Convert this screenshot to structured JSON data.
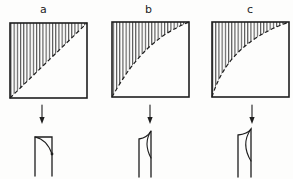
{
  "figure": {
    "description_labels": {
      "panel_a": "a",
      "panel_b": "b",
      "panel_c": "c"
    },
    "panels": [
      {
        "label": "a"
      },
      {
        "label": "b"
      },
      {
        "label": "c"
      }
    ]
  },
  "colors": {
    "ink": "#1e1e1e",
    "paper": "#fdfdfc"
  }
}
